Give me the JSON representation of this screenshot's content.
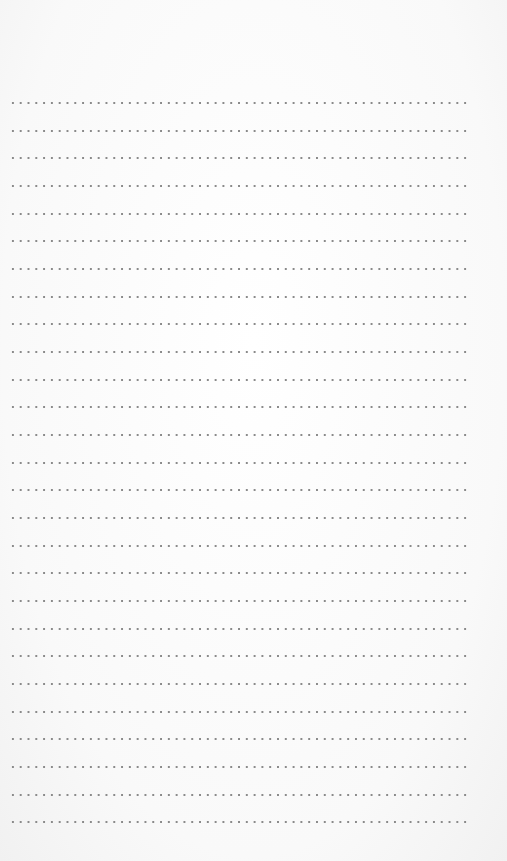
{
  "page": {
    "type": "dotted-lined-writing-sheet",
    "background_color": "#fbfbfb",
    "dot_color": "#8a8a8a",
    "line_count": 27,
    "first_line_y": 102,
    "line_spacing": 27.66,
    "line_left": 9,
    "line_width": 461,
    "dot_spacing": 7.8
  }
}
